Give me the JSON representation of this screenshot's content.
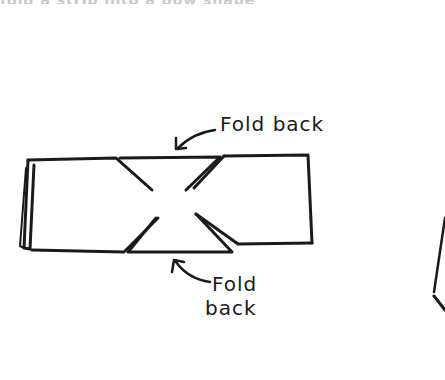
{
  "top_text_fragment": "fold a strip into a bow shape",
  "diagram": {
    "labels": {
      "top_label": "Fold back",
      "bottom_label_line1": "Fold",
      "bottom_label_line2": "back"
    },
    "stroke_color": "#1a1a1a"
  }
}
